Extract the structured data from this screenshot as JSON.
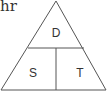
{
  "header_fragment": "hr",
  "triangle": {
    "top": "D",
    "bottom_left": "S",
    "bottom_right": "T"
  },
  "colors": {
    "line": "#555555",
    "text": "#333333",
    "background": "#ffffff"
  }
}
